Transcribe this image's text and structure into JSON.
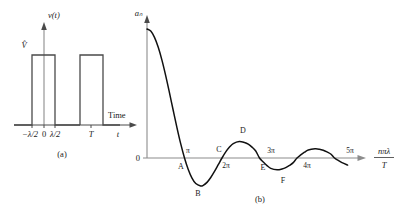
{
  "figure": {
    "background_color": "#ffffff",
    "ink_color": "#1a1a1a",
    "axis_color": "#4a4a4a",
    "axis_gray_color": "#8c8c8c",
    "curve_color": "#111111"
  },
  "panel_a": {
    "caption": "(a)",
    "y_axis_label": "v(t)",
    "y_amplitude_label": "V̂",
    "x_axis_label": "t",
    "x_axis_name": "Time",
    "tick_labels": [
      {
        "text": "−λ/2",
        "value": -0.5
      },
      {
        "text": "0",
        "value": 0
      },
      {
        "text": "λ/2",
        "value": 0.5
      },
      {
        "text": "T",
        "value": 4.0
      }
    ],
    "pulses": [
      {
        "start": -0.5,
        "end": 0.5,
        "height": 1
      },
      {
        "start": 3.5,
        "end": 4.5,
        "height": 1
      }
    ]
  },
  "panel_b": {
    "caption": "(b)",
    "y_axis_label": "aₙ",
    "y_zero_label": "0",
    "x_axis_label_numerator": "nπλ",
    "x_axis_label_denominator": "T",
    "tick_labels": [
      {
        "text": "π",
        "value": 1,
        "position": "above"
      },
      {
        "text": "2π",
        "value": 2,
        "position": "below"
      },
      {
        "text": "3π",
        "value": 3,
        "position": "above"
      },
      {
        "text": "4π",
        "value": 4,
        "position": "below"
      },
      {
        "text": "5π",
        "value": 5,
        "position": "above"
      }
    ],
    "point_labels": [
      {
        "text": "A",
        "value": 1,
        "position": "below"
      },
      {
        "text": "B",
        "value": 1.43,
        "position": "below"
      },
      {
        "text": "C",
        "value": 2,
        "position": "above"
      },
      {
        "text": "D",
        "value": 2.46,
        "position": "above"
      },
      {
        "text": "E",
        "value": 3,
        "position": "below"
      },
      {
        "text": "F",
        "value": 3.47,
        "position": "below"
      },
      {
        "text": "5π crossing",
        "value": 5,
        "position": "above"
      }
    ]
  },
  "chart_data": {
    "type": "line",
    "subtitle": "sinc envelope",
    "xlabel": "nπλ / T",
    "ylabel": "aₙ",
    "xlim": [
      0,
      5.6
    ],
    "ylim": [
      -0.32,
      1.0
    ],
    "grid": false,
    "legend": null,
    "function": "sinc(x) = sin(pi*x)/(pi*x)",
    "x_tick_values": [
      1,
      2,
      3,
      4,
      5
    ],
    "x_tick_labels": [
      "π",
      "2π",
      "3π",
      "4π",
      "5π"
    ],
    "y_tick_values": [
      0
    ],
    "y_tick_labels": [
      "0"
    ],
    "annotations": [
      {
        "label": "A",
        "x": 1.0,
        "y": 0.0,
        "note": "first zero crossing"
      },
      {
        "label": "B",
        "x": 1.43,
        "y": -0.217,
        "note": "first negative minimum"
      },
      {
        "label": "C",
        "x": 2.0,
        "y": 0.0,
        "note": "second zero crossing"
      },
      {
        "label": "D",
        "x": 2.46,
        "y": 0.128,
        "note": "first positive side lobe peak"
      },
      {
        "label": "E",
        "x": 3.0,
        "y": 0.0,
        "note": "third zero crossing"
      },
      {
        "label": "F",
        "x": 3.47,
        "y": -0.091,
        "note": "second negative minimum"
      },
      {
        "label": "G",
        "x": 4.0,
        "y": 0.0,
        "note": "fourth zero crossing"
      },
      {
        "label": "H",
        "x": 4.48,
        "y": 0.071,
        "note": "second positive side lobe peak"
      },
      {
        "label": "I",
        "x": 5.0,
        "y": 0.0,
        "note": "fifth zero crossing"
      }
    ],
    "series": [
      {
        "name": "a_n envelope",
        "x": [
          0.0,
          0.1,
          0.2,
          0.3,
          0.4,
          0.5,
          0.6,
          0.7,
          0.8,
          0.9,
          1.0,
          1.1,
          1.2,
          1.3,
          1.43,
          1.5,
          1.6,
          1.7,
          1.8,
          1.9,
          2.0,
          2.1,
          2.2,
          2.3,
          2.46,
          2.6,
          2.7,
          2.8,
          2.9,
          3.0,
          3.1,
          3.2,
          3.3,
          3.47,
          3.6,
          3.7,
          3.8,
          3.9,
          4.0,
          4.1,
          4.2,
          4.3,
          4.48,
          4.6,
          4.7,
          4.8,
          4.9,
          5.0,
          5.1,
          5.2,
          5.35
        ],
        "values": [
          1.0,
          0.984,
          0.935,
          0.858,
          0.757,
          0.637,
          0.505,
          0.368,
          0.234,
          0.109,
          0.0,
          -0.089,
          -0.156,
          -0.198,
          -0.217,
          -0.212,
          -0.189,
          -0.151,
          -0.104,
          -0.052,
          0.0,
          0.047,
          0.085,
          0.112,
          0.128,
          0.12,
          0.107,
          0.084,
          0.054,
          0.0,
          -0.031,
          -0.059,
          -0.08,
          -0.091,
          -0.085,
          -0.075,
          -0.058,
          -0.036,
          0.0,
          0.024,
          0.045,
          0.062,
          0.071,
          0.068,
          0.06,
          0.047,
          0.031,
          0.0,
          -0.019,
          -0.036,
          -0.055
        ]
      }
    ]
  }
}
